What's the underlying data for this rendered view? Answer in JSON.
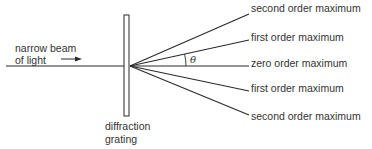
{
  "diagram": {
    "incident_label_line1": "narrow beam",
    "incident_label_line2": "of light",
    "grating_label_line1": "diffraction",
    "grating_label_line2": "grating",
    "angle_symbol": "θ",
    "maxima": [
      {
        "label": "second order maximum",
        "end_y": 14
      },
      {
        "label": "first order maximum",
        "end_y": 40
      },
      {
        "label": "zero order maximum",
        "end_y": 66
      },
      {
        "label": "first order maximum",
        "end_y": 91
      },
      {
        "label": "second order maximum",
        "end_y": 115
      }
    ],
    "colors": {
      "line": "#2a2a2a",
      "background": "#ffffff"
    }
  }
}
